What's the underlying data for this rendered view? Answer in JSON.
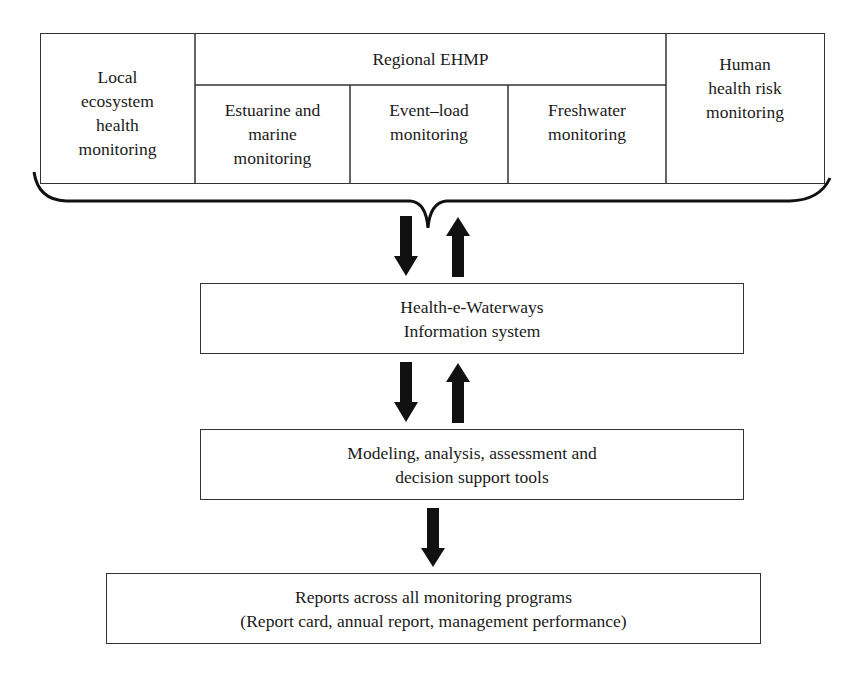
{
  "diagram": {
    "top_table": {
      "left_cell": "Local\necosystem\nhealth\nmonitoring",
      "group_header": "Regional EHMP",
      "group_cells": [
        "Estuarine and\nmarine\nmonitoring",
        "Event–load\nmonitoring",
        "Freshwater\nmonitoring"
      ],
      "right_cell": "Human\nhealth risk\nmonitoring"
    },
    "info_system": "Health-e-Waterways\nInformation system",
    "tools": "Modeling, analysis, assessment and\ndecision support tools",
    "reports": "Reports across all monitoring programs\n(Report card, annual report, management performance)",
    "connectors": {
      "table_to_info": [
        "down-arrow",
        "up-arrow"
      ],
      "info_to_tools": [
        "down-arrow",
        "up-arrow"
      ],
      "tools_to_reports": [
        "down-arrow"
      ]
    },
    "colors": {
      "line": "#333333",
      "arrow": "#111111",
      "background": "#ffffff"
    }
  }
}
